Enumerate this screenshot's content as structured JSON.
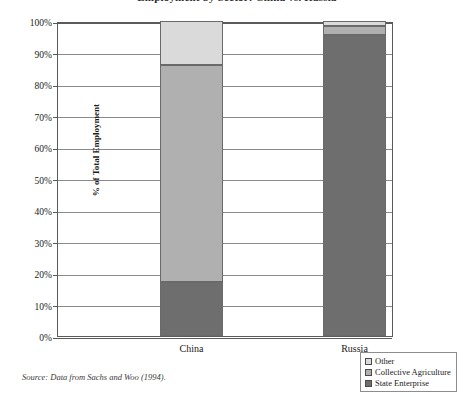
{
  "figure": {
    "title": "Employment by Sector: China vs. Russia",
    "source_note": "Source: Data from Sachs and Woo (1994)."
  },
  "legend": {
    "position": "bottom-right",
    "items": [
      {
        "label": "Other",
        "color": "#dadada",
        "name": "other"
      },
      {
        "label": "Collective Agriculture",
        "color": "#b0b0b0",
        "name": "collective-agriculture"
      },
      {
        "label": "State Enterprise",
        "color": "#6e6e6e",
        "name": "state-enterprise"
      }
    ]
  },
  "axes": {
    "y_title": "% of Total Employment",
    "y_ticks": [
      "100%",
      "90%",
      "80%",
      "70%",
      "60%",
      "50%",
      "40%",
      "30%",
      "20%",
      "10%",
      "0%"
    ],
    "y_tick_values": [
      100,
      90,
      80,
      70,
      60,
      50,
      40,
      30,
      20,
      10,
      0
    ],
    "x_ticks": [
      "China",
      "Russia"
    ]
  },
  "chart_data": {
    "type": "bar",
    "stacked": true,
    "title": "Employment by Sector: China vs. Russia",
    "xlabel": "",
    "ylabel": "% of Total Employment",
    "ylim": [
      0,
      100
    ],
    "grid": true,
    "legend_position": "bottom-right",
    "categories": [
      "China",
      "Russia"
    ],
    "series": [
      {
        "name": "State Enterprise",
        "color": "#6e6e6e",
        "values": [
          17,
          95.5
        ]
      },
      {
        "name": "Collective Agriculture",
        "color": "#b0b0b0",
        "values": [
          69,
          3
        ]
      },
      {
        "name": "Other",
        "color": "#dadada",
        "values": [
          14,
          1.5
        ]
      }
    ],
    "cumulative_tops": {
      "China": {
        "State Enterprise": 17,
        "Collective Agriculture": 86,
        "Other": 100
      },
      "Russia": {
        "State Enterprise": 95.5,
        "Collective Agriculture": 98.5,
        "Other": 100
      }
    },
    "annotations": [
      "Source: Data from Sachs and Woo (1994)."
    ]
  }
}
